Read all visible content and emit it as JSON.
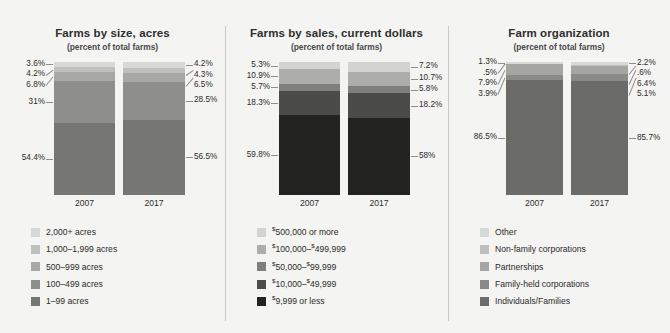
{
  "background_color": "#f4f4f2",
  "chart_data": [
    {
      "type": "bar",
      "title": "Farms by size, acres",
      "subtitle": "(percent of total farms)",
      "xlabel": "",
      "ylabel": "",
      "ylim": [
        0,
        100
      ],
      "grid": false,
      "legend_position": "bottom",
      "stacked": true,
      "categories": [
        "2007",
        "2017"
      ],
      "series": [
        {
          "name": "2,000+ acres",
          "color": "#d8d8d6",
          "values": [
            3.6,
            4.2
          ],
          "labels": [
            "3.6%",
            "4.2%"
          ]
        },
        {
          "name": "1,000–1,999 acres",
          "color": "#c0c0bd",
          "values": [
            4.2,
            4.3
          ],
          "labels": [
            "4.2%",
            "4.3%"
          ]
        },
        {
          "name": "500–999 acres",
          "color": "#a8a8a5",
          "values": [
            6.8,
            6.5
          ],
          "labels": [
            "6.8%",
            "6.5%"
          ]
        },
        {
          "name": "100–499 acres",
          "color": "#8e8e8b",
          "values": [
            31.0,
            28.5
          ],
          "labels": [
            "31%",
            "28.5%"
          ]
        },
        {
          "name": "1–99 acres",
          "color": "#767673",
          "values": [
            54.4,
            56.5
          ],
          "labels": [
            "54.4%",
            "56.5%"
          ]
        }
      ]
    },
    {
      "type": "bar",
      "title": "Farms by sales, current dollars",
      "subtitle": "(percent of total farms)",
      "xlabel": "",
      "ylabel": "",
      "ylim": [
        0,
        100
      ],
      "grid": false,
      "legend_position": "bottom",
      "stacked": true,
      "categories": [
        "2007",
        "2017"
      ],
      "series": [
        {
          "name": "$500,000 or more",
          "name_prefix": "$",
          "name_rest": "500,000 or more",
          "color": "#d3d3d0",
          "values": [
            5.3,
            7.2
          ],
          "labels": [
            "5.3%",
            "7.2%"
          ]
        },
        {
          "name": "$100,000–$499,999",
          "name_prefix": "$",
          "name_rest": "100,000–$499,999",
          "color": "#adadaa",
          "values": [
            10.9,
            10.7
          ],
          "labels": [
            "10.9%",
            "10.7%"
          ]
        },
        {
          "name": "$50,000–$99,999",
          "name_prefix": "$",
          "name_rest": "50,000–$99,999",
          "color": "#7f7f7c",
          "values": [
            5.7,
            5.8
          ],
          "labels": [
            "5.7%",
            "5.8%"
          ]
        },
        {
          "name": "$10,000–$49,999",
          "name_prefix": "$",
          "name_rest": "10,000–$49,999",
          "color": "#4b4b49",
          "values": [
            18.3,
            18.2
          ],
          "labels": [
            "18.3%",
            "18.2%"
          ]
        },
        {
          "name": "$9,999 or less",
          "name_prefix": "$",
          "name_rest": "9,999 or less",
          "color": "#232322",
          "values": [
            59.8,
            58.0
          ],
          "labels": [
            "59.8%",
            "58%"
          ]
        }
      ]
    },
    {
      "type": "bar",
      "title": "Farm organization",
      "subtitle": "(percent of total farms)",
      "xlabel": "",
      "ylabel": "",
      "ylim": [
        0,
        100
      ],
      "grid": false,
      "legend_position": "bottom",
      "stacked": true,
      "categories": [
        "2007",
        "2017"
      ],
      "series": [
        {
          "name": "Other",
          "color": "#d8d8d6",
          "values": [
            1.3,
            2.2
          ],
          "labels": [
            "1.3%",
            "2.2%"
          ]
        },
        {
          "name": "Non-family corporations",
          "color": "#bfbfbc",
          "values": [
            0.5,
            0.6
          ],
          "labels": [
            ".5%",
            ".6%"
          ]
        },
        {
          "name": "Partnerships",
          "color": "#a5a5a2",
          "values": [
            7.9,
            6.4
          ],
          "labels": [
            "7.9%",
            "6.4%"
          ]
        },
        {
          "name": "Family-held corporations",
          "color": "#8a8a87",
          "values": [
            3.9,
            5.1
          ],
          "labels": [
            "3.9%",
            "5.1%"
          ]
        },
        {
          "name": "Individuals/Families",
          "color": "#6b6b68",
          "values": [
            86.5,
            85.7
          ],
          "labels": [
            "86.5%",
            "85.7%"
          ]
        }
      ]
    }
  ]
}
